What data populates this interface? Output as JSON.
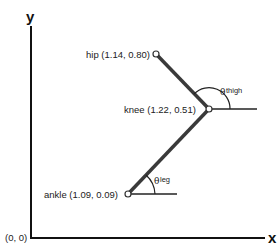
{
  "axes": {
    "x_label": "x",
    "y_label": "y",
    "origin_label": "(0, 0)"
  },
  "joints": {
    "hip": {
      "label": "hip (1.14, 0.80)"
    },
    "knee": {
      "label": "knee (1.22, 0.51)"
    },
    "ankle": {
      "label": "ankle (1.09, 0.09)"
    }
  },
  "angles": {
    "thigh": {
      "symbol": "θ",
      "subscript": "thigh"
    },
    "leg": {
      "symbol": "θ",
      "subscript": "leg"
    }
  },
  "colors": {
    "segment": "#3a3a3a",
    "axis": "#111111"
  }
}
